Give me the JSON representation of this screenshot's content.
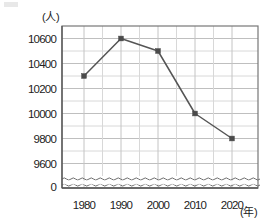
{
  "chart_data": {
    "type": "line",
    "title": "",
    "subtitle": "",
    "xlabel": "年",
    "ylabel": "人",
    "x": [
      1980,
      1990,
      2000,
      2010,
      2020
    ],
    "categories": [
      "1980",
      "1990",
      "2000",
      "2010",
      "2020"
    ],
    "values": [
      10300,
      10600,
      10500,
      10000,
      9800
    ],
    "series": [
      {
        "name": "",
        "values": [
          10300,
          10600,
          10500,
          10000,
          9800
        ]
      }
    ],
    "ylim": [
      9500,
      10700
    ],
    "y_major_ticks": [
      9600,
      9800,
      10000,
      10200,
      10400,
      10600
    ],
    "y_tick_labels": [
      "9600",
      "9800",
      "10000",
      "10200",
      "10400",
      "10600"
    ],
    "y_minor_step": 100,
    "zero_label": "0",
    "axis_break": true,
    "grid": true,
    "legend": false,
    "marker": "square",
    "line_color": "#555555",
    "grid_color": "#cccccc",
    "frame_color": "#777777"
  },
  "axis": {
    "y_unit": "(人)",
    "x_unit": "(年)"
  }
}
